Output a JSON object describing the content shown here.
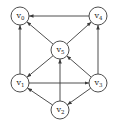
{
  "diagram": {
    "type": "directed-graph",
    "nodes": [
      {
        "id": "v0",
        "label": "v",
        "sub": "0",
        "x": 20,
        "y": 16
      },
      {
        "id": "v4",
        "label": "v",
        "sub": "4",
        "x": 98,
        "y": 16
      },
      {
        "id": "v5",
        "label": "v",
        "sub": "5",
        "x": 60,
        "y": 50
      },
      {
        "id": "v1",
        "label": "v",
        "sub": "1",
        "x": 20,
        "y": 83
      },
      {
        "id": "v3",
        "label": "v",
        "sub": "3",
        "x": 98,
        "y": 83
      },
      {
        "id": "v2",
        "label": "v",
        "sub": "2",
        "x": 60,
        "y": 110
      }
    ],
    "edges": [
      {
        "from": "v4",
        "to": "v0"
      },
      {
        "from": "v5",
        "to": "v0"
      },
      {
        "from": "v5",
        "to": "v4"
      },
      {
        "from": "v1",
        "to": "v0"
      },
      {
        "from": "v5",
        "to": "v1"
      },
      {
        "from": "v3",
        "to": "v5"
      },
      {
        "from": "v3",
        "to": "v4"
      },
      {
        "from": "v1",
        "to": "v3"
      },
      {
        "from": "v2",
        "to": "v5"
      },
      {
        "from": "v2",
        "to": "v1"
      },
      {
        "from": "v3",
        "to": "v2"
      }
    ]
  }
}
